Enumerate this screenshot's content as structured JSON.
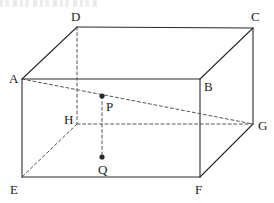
{
  "figure": {
    "name": "rectangular-prism-with-interior-points",
    "canvas": {
      "width": 274,
      "height": 203
    },
    "stroke_color": "#2b2b2b",
    "dash_color": "#555555",
    "label_color": "#1c1c1c",
    "background": "#ffffff",
    "solid_stroke_width": 1.1,
    "dashed_stroke_width": 1,
    "dash_pattern": "3,2.6"
  },
  "vertices": [
    {
      "id": "A",
      "label": "A",
      "x": 22,
      "y": 79,
      "label_x": 9,
      "label_y": 72
    },
    {
      "id": "B",
      "label": "B",
      "x": 200,
      "y": 79,
      "label_x": 204,
      "label_y": 80
    },
    {
      "id": "C",
      "label": "C",
      "x": 253,
      "y": 28,
      "label_x": 251,
      "label_y": 10
    },
    {
      "id": "D",
      "label": "D",
      "x": 77,
      "y": 27,
      "label_x": 71,
      "label_y": 10
    },
    {
      "id": "E",
      "label": "E",
      "x": 22,
      "y": 177,
      "label_x": 10,
      "label_y": 183
    },
    {
      "id": "F",
      "label": "F",
      "x": 200,
      "y": 177,
      "label_x": 195,
      "label_y": 183
    },
    {
      "id": "G",
      "label": "G",
      "x": 253,
      "y": 124,
      "label_x": 258,
      "label_y": 119
    },
    {
      "id": "H",
      "label": "H",
      "x": 77,
      "y": 124,
      "label_x": 64,
      "label_y": 113
    }
  ],
  "interior_points": [
    {
      "id": "P",
      "label": "P",
      "x": 102,
      "y": 96,
      "label_x": 106,
      "label_y": 100,
      "radius": 2.6
    },
    {
      "id": "Q",
      "label": "Q",
      "x": 102,
      "y": 157,
      "label_x": 98,
      "label_y": 163,
      "radius": 2.6
    }
  ],
  "solid_edges": [
    {
      "name": "edge-A-D",
      "from": "A",
      "to": "D"
    },
    {
      "name": "edge-D-C",
      "from": "D",
      "to": "C"
    },
    {
      "name": "edge-C-B",
      "from": "C",
      "to": "B"
    },
    {
      "name": "edge-B-A",
      "from": "B",
      "to": "A"
    },
    {
      "name": "edge-A-E",
      "from": "A",
      "to": "E"
    },
    {
      "name": "edge-B-F",
      "from": "B",
      "to": "F"
    },
    {
      "name": "edge-C-G",
      "from": "C",
      "to": "G"
    },
    {
      "name": "edge-E-F",
      "from": "E",
      "to": "F"
    },
    {
      "name": "edge-F-G",
      "from": "F",
      "to": "G"
    }
  ],
  "dashed_edges": [
    {
      "name": "edge-D-H",
      "from": "D",
      "to": "H"
    },
    {
      "name": "edge-H-G",
      "from": "H",
      "to": "G"
    },
    {
      "name": "edge-H-E",
      "from": "H",
      "to": "E"
    }
  ],
  "dashed_constructions": [
    {
      "name": "diagonal-A-G",
      "from": "A",
      "to": "G"
    },
    {
      "name": "segment-P-Q",
      "from": "P",
      "to": "Q"
    }
  ]
}
